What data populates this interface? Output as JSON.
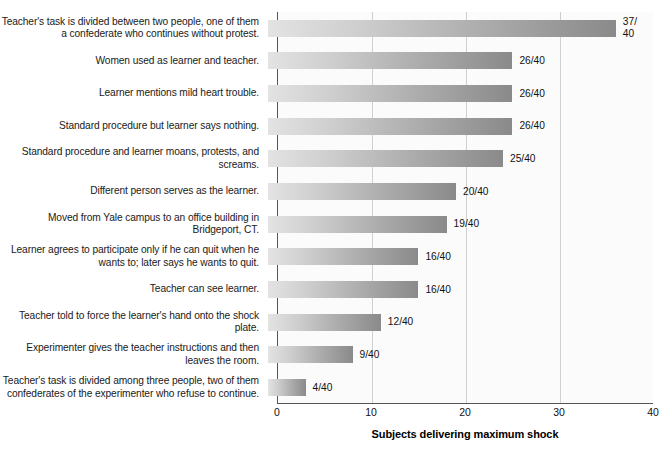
{
  "chart_data": {
    "type": "bar",
    "orientation": "horizontal",
    "title": "",
    "xlabel": "Subjects delivering maximum shock",
    "ylabel": "",
    "xlim": [
      0,
      40
    ],
    "xticks": [
      0,
      10,
      20,
      30,
      40
    ],
    "xtick_labels": [
      "0",
      "10",
      "20",
      "30",
      "40"
    ],
    "grid": "vertical gridlines at 10, 20, 30",
    "legend": "none",
    "total_subjects": 40,
    "categories": [
      "Teacher's task is divided between two people, one of them a confederate who continues without protest.",
      "Women used as learner and teacher.",
      "Learner mentions mild heart trouble.",
      "Standard procedure but learner says nothing.",
      "Standard procedure and learner moans, protests, and screams.",
      "Different person serves as the learner.",
      "Moved from Yale campus to an office building in Bridgeport, CT.",
      "Learner agrees to participate only if he can quit when he wants to; later says he wants to quit.",
      "Teacher can see learner.",
      "Teacher told to force the learner's hand onto the shock plate.",
      "Experimenter gives the teacher instructions and then leaves the room.",
      "Teacher's task is divided among three people, two of them confederates of the experimenter who refuse to continue."
    ],
    "values": [
      37,
      26,
      26,
      26,
      25,
      20,
      19,
      16,
      16,
      12,
      9,
      4
    ],
    "value_labels": [
      "37/\n40",
      "26/40",
      "26/40",
      "26/40",
      "25/40",
      "20/40",
      "19/40",
      "16/40",
      "16/40",
      "12/40",
      "9/40",
      "4/40"
    ]
  },
  "style": {
    "bar_gradient_start": "#e3e3e3",
    "bar_gradient_end": "#8a8a8a",
    "plot_background": "#fbfbfb",
    "gridline_color": "#d0d0d0",
    "axis_color": "#555555",
    "text_color": "#1a1a1a"
  }
}
